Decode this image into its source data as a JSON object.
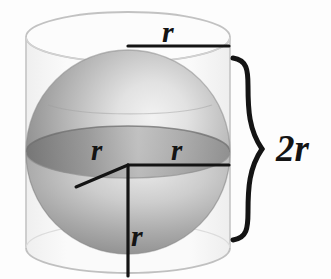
{
  "figure": {
    "background_color": "#fdfdfd",
    "line_color": "#141414",
    "cylinder_outline_color": "#c9c9c9",
    "labels": {
      "top_radius": "r",
      "equator_left_radius": "r",
      "equator_right_radius": "r",
      "vertical_radius": "r",
      "height_brace": "2r"
    },
    "geometry": {
      "cylinder": {
        "left_x": 26,
        "right_x": 230,
        "top_ellipse_center_y": 37,
        "bottom_ellipse_center_y": 248,
        "ellipse_rx": 102,
        "ellipse_ry": 25
      },
      "sphere": {
        "center_x": 128,
        "center_y": 152,
        "radius": 102,
        "equator_ry": 26
      },
      "brace": {
        "x": 243,
        "top_y": 57,
        "bottom_y": 241,
        "tip_y": 149
      },
      "radius_lines": {
        "top": {
          "x1": 128,
          "y1": 46,
          "x2": 229,
          "y2": 46
        },
        "equator_right": {
          "x1": 128,
          "y1": 165,
          "x2": 229,
          "y2": 165
        },
        "equator_left_slant": {
          "x1": 128,
          "y1": 165,
          "x2": 76,
          "y2": 187
        },
        "vertical": {
          "x1": 128,
          "y1": 165,
          "x2": 128,
          "y2": 276
        }
      }
    },
    "colors": {
      "sphere_dark": "#7d7d7d",
      "sphere_mid": "#a9a9a9",
      "sphere_light": "#eaeaea",
      "equator_band": "#8d8d8d",
      "cylinder_wall": "#f4f4f4",
      "accent": "#141414"
    }
  }
}
